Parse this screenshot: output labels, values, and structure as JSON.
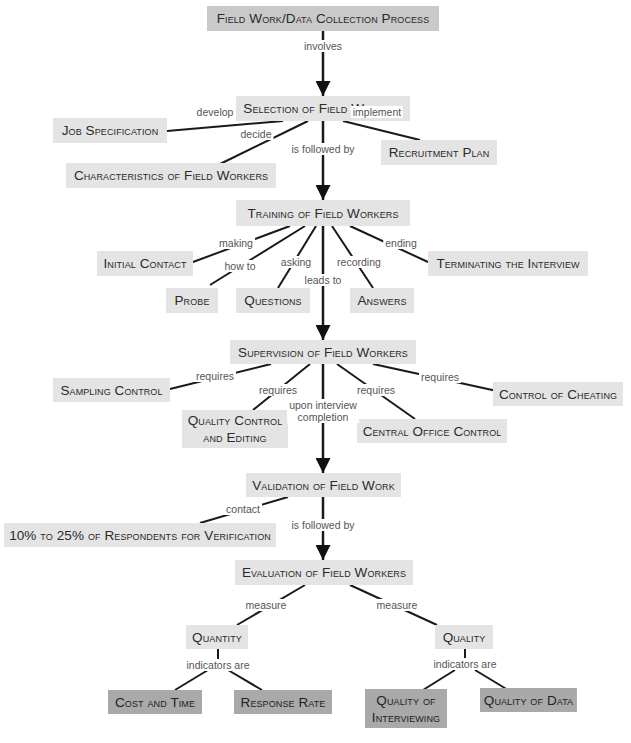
{
  "diagram": {
    "title": "Field Work/Data Collection Process",
    "nodes": {
      "root": "Field Work/Data Collection Process",
      "selection": "Selection of Field Workers",
      "job_spec": "Job Specification",
      "characteristics": "Characteristics of Field Workers",
      "recruitment": "Recruitment Plan",
      "training": "Training of Field Workers",
      "initial_contact": "Initial Contact",
      "probe": "Probe",
      "questions": "Questions",
      "answers": "Answers",
      "terminating": "Terminating the Interview",
      "supervision": "Supervision of Field Workers",
      "sampling_control": "Sampling Control",
      "quality_control": "Quality Control\nand Editing",
      "central_office": "Central Office Control",
      "cheating": "Control of Cheating",
      "validation": "Validation of Field Work",
      "respondents": "10% to 25% of Respondents for Verification",
      "evaluation": "Evaluation of Field Workers",
      "quantity": "Quantity",
      "quality": "Quality",
      "cost_time": "Cost and Time",
      "response_rate": "Response Rate",
      "quality_interviewing": "Quality of\nInterviewing",
      "quality_data": "Quality of Data"
    },
    "edges": {
      "involves": "involves",
      "develop": "develop",
      "decide": "decide",
      "implement": "implement",
      "followed1": "is followed by",
      "making": "making",
      "how_to": "how to",
      "asking": "asking",
      "leads_to": "leads to",
      "recording": "recording",
      "ending": "ending",
      "req1": "requires",
      "req2": "requires",
      "req3": "requires",
      "req4": "requires",
      "upon": "upon interview\ncompletion",
      "contact": "contact",
      "followed2": "is followed by",
      "measure1": "measure",
      "measure2": "measure",
      "indicators1": "indicators are",
      "indicators2": "indicators are"
    },
    "colors": {
      "light_box": "#e4e4e4",
      "mid_box": "#c9c9c9",
      "dark_box": "#a9a9a9",
      "line": "#1a1a1a"
    }
  }
}
